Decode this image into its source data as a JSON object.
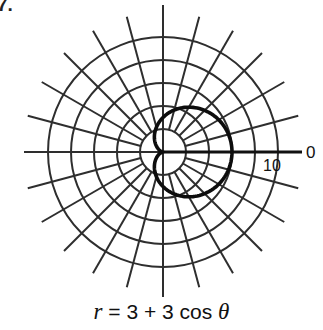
{
  "problem_number": "7.",
  "caption": {
    "lhs": "r",
    "rhs": " = 3 + 3 cos ",
    "theta": "θ"
  },
  "chart_data": {
    "type": "line",
    "coordinate_system": "polar",
    "title": "",
    "equation": "r = 3 + 3 cos θ",
    "curve": "cardioid",
    "theta_range_deg": [
      0,
      360
    ],
    "r_max": 10,
    "rings": [
      2,
      4,
      6,
      8,
      10
    ],
    "spoke_step_deg": 15,
    "axis_labels": [
      {
        "text": "0",
        "position": "end of polar axis",
        "meaning": "θ = 0"
      },
      {
        "text": "10",
        "position": "outer ring on polar axis",
        "meaning": "r = 10"
      }
    ],
    "points": [
      {
        "theta_deg": 0,
        "r": 6
      },
      {
        "theta_deg": 30,
        "r": 5.598
      },
      {
        "theta_deg": 60,
        "r": 4.5
      },
      {
        "theta_deg": 90,
        "r": 3
      },
      {
        "theta_deg": 120,
        "r": 1.5
      },
      {
        "theta_deg": 150,
        "r": 0.402
      },
      {
        "theta_deg": 180,
        "r": 0
      },
      {
        "theta_deg": 210,
        "r": 0.402
      },
      {
        "theta_deg": 240,
        "r": 1.5
      },
      {
        "theta_deg": 270,
        "r": 3
      },
      {
        "theta_deg": 300,
        "r": 4.5
      },
      {
        "theta_deg": 330,
        "r": 5.598
      },
      {
        "theta_deg": 360,
        "r": 6
      }
    ],
    "grid": true,
    "legend": null
  },
  "plot": {
    "center_x": 163,
    "center_y": 152,
    "px_per_unit": 11.5,
    "spoke_inner_radius": 23,
    "spoke_outer_radius": 140,
    "axis_left_end": 24,
    "axis_right_end": 302,
    "grid_color": "#2e2e2e",
    "curve_color": "#0d0d0d",
    "label_zero": "0",
    "label_ten": "10"
  }
}
